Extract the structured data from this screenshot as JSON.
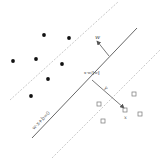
{
  "diagram": {
    "colors": {
      "background": "#ffffff",
      "hyperplane": "#555555",
      "margin": "#bbbbbb",
      "positive_point": "#111111",
      "negative_point": "#777777",
      "vector": "#555555"
    },
    "labels": {
      "hyperplane": "w·x+b=0",
      "normal_vector": "w",
      "distance_label": "γ",
      "support_label": "x",
      "projection_label": "x·w/‖w‖"
    },
    "hyperplane": {
      "x1": 32,
      "y1": 138,
      "x2": 137,
      "y2": 28
    },
    "margin_upper": {
      "x1": 10,
      "y1": 100,
      "x2": 118,
      "y2": 2
    },
    "margin_lower": {
      "x1": 52,
      "y1": 158,
      "x2": 160,
      "y2": 50
    },
    "normal_vector": {
      "x1": 109,
      "y1": 56,
      "x2": 97,
      "y2": 41
    },
    "distance_segment": {
      "x1": 92,
      "y1": 80,
      "x2": 124,
      "y2": 108
    },
    "class_dots": [
      {
        "x": 44,
        "y": 35
      },
      {
        "x": 69,
        "y": 38
      },
      {
        "x": 13,
        "y": 61
      },
      {
        "x": 36,
        "y": 59
      },
      {
        "x": 62,
        "y": 64
      },
      {
        "x": 48,
        "y": 79
      },
      {
        "x": 31,
        "y": 96
      }
    ],
    "class_squares": [
      {
        "x": 134,
        "y": 94
      },
      {
        "x": 125,
        "y": 110
      },
      {
        "x": 140,
        "y": 114
      },
      {
        "x": 99,
        "y": 104
      },
      {
        "x": 103,
        "y": 121
      }
    ]
  }
}
